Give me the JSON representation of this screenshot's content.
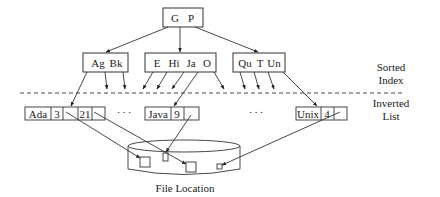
{
  "diagram": {
    "root_node": {
      "keys": [
        "G",
        "P"
      ]
    },
    "internal_nodes": [
      {
        "keys": [
          "Ag",
          "Bk"
        ]
      },
      {
        "keys": [
          "E",
          "Hi",
          "Ja",
          "O"
        ]
      },
      {
        "keys": [
          "Qu",
          "T",
          "Un"
        ]
      }
    ],
    "inverted_lists": [
      {
        "term": "Ada",
        "cells": [
          "3",
          "",
          "21",
          ""
        ]
      },
      {
        "term": "Java",
        "cells": [
          "9",
          ""
        ]
      },
      {
        "term": "Unix",
        "cells": [
          "4",
          ""
        ]
      }
    ],
    "ellipsis": ". . .",
    "layer_labels": {
      "sorted_line1": "Sorted",
      "sorted_line2": "Index",
      "inverted_line1": "Inverted",
      "inverted_line2": "List"
    },
    "file_location_label": "File Location",
    "colors": {
      "stroke": "#333333",
      "background": "#ffffff"
    }
  }
}
